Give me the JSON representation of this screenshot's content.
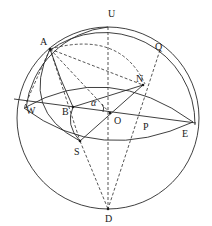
{
  "diagram": {
    "points": {
      "U": "U",
      "Q": "Q",
      "A": "A",
      "N": "N",
      "W": "W",
      "B": "B",
      "alpha": "α",
      "O": "O",
      "P": "P",
      "E": "E",
      "S": "S",
      "D": "D"
    }
  }
}
